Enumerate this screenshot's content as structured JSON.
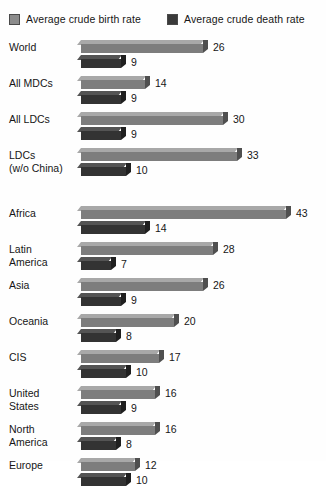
{
  "legend": {
    "birth": {
      "label": "Average crude birth rate",
      "color": "#8c8c8c",
      "icon": "legend-swatch-icon"
    },
    "death": {
      "label": "Average crude death rate",
      "color": "#3a3a3a",
      "icon": "legend-swatch-icon"
    }
  },
  "chart_data": {
    "type": "bar",
    "orientation": "horizontal",
    "title": "",
    "subtitle": "",
    "xlabel": "",
    "ylabel": "",
    "xlim": [
      0,
      43
    ],
    "grid": false,
    "legend_position": "top",
    "value_labels": true,
    "units": "per 1,000 population",
    "categories": [
      "World",
      "All MDCs",
      "All LDCs",
      "LDCs\n(w/o China)",
      "Africa",
      "Latin\nAmerica",
      "Asia",
      "Oceania",
      "CIS",
      "United\nStates",
      "North\nAmerica",
      "Europe"
    ],
    "series": [
      {
        "name": "Average crude birth rate",
        "color": "#8c8c8c",
        "values": [
          26,
          14,
          30,
          33,
          43,
          28,
          26,
          20,
          17,
          16,
          16,
          12
        ]
      },
      {
        "name": "Average crude death rate",
        "color": "#3a3a3a",
        "values": [
          9,
          9,
          9,
          10,
          14,
          7,
          9,
          8,
          10,
          9,
          8,
          10
        ]
      }
    ],
    "groups": [
      {
        "name": "development-groups",
        "categories": [
          "World",
          "All MDCs",
          "All LDCs",
          "LDCs\n(w/o China)"
        ]
      },
      {
        "name": "regions",
        "categories": [
          "Africa",
          "Latin\nAmerica",
          "Asia",
          "Oceania",
          "CIS",
          "United\nStates",
          "North\nAmerica",
          "Europe"
        ]
      }
    ]
  }
}
